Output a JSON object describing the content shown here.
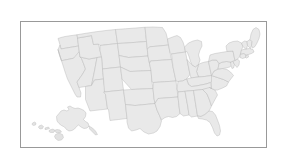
{
  "figure": {
    "type": "choropleth-base-map",
    "title": "",
    "subtitle": "",
    "background_color": "#ffffff"
  },
  "frame": {
    "name": "map-border",
    "stroke_color": "#999999",
    "stroke_width_px": 1,
    "x": 20,
    "y": 21,
    "width": 247,
    "height": 127
  },
  "map": {
    "name": "united-states-map",
    "region": "United States of America",
    "projection": "albers-usa",
    "land_fill_color": "#e9e9e9",
    "state_border_color": "#b8b8b8",
    "state_border_width_px": 0.45,
    "includes_alaska": true,
    "includes_hawaii": true,
    "labels_visible": false,
    "legend_visible": false,
    "states": [
      {
        "code": "WA",
        "name": "Washington"
      },
      {
        "code": "OR",
        "name": "Oregon"
      },
      {
        "code": "CA",
        "name": "California"
      },
      {
        "code": "NV",
        "name": "Nevada"
      },
      {
        "code": "ID",
        "name": "Idaho"
      },
      {
        "code": "MT",
        "name": "Montana"
      },
      {
        "code": "WY",
        "name": "Wyoming"
      },
      {
        "code": "UT",
        "name": "Utah"
      },
      {
        "code": "AZ",
        "name": "Arizona"
      },
      {
        "code": "CO",
        "name": "Colorado"
      },
      {
        "code": "NM",
        "name": "New Mexico"
      },
      {
        "code": "ND",
        "name": "North Dakota"
      },
      {
        "code": "SD",
        "name": "South Dakota"
      },
      {
        "code": "NE",
        "name": "Nebraska"
      },
      {
        "code": "KS",
        "name": "Kansas"
      },
      {
        "code": "OK",
        "name": "Oklahoma"
      },
      {
        "code": "TX",
        "name": "Texas"
      },
      {
        "code": "MN",
        "name": "Minnesota"
      },
      {
        "code": "IA",
        "name": "Iowa"
      },
      {
        "code": "MO",
        "name": "Missouri"
      },
      {
        "code": "AR",
        "name": "Arkansas"
      },
      {
        "code": "LA",
        "name": "Louisiana"
      },
      {
        "code": "WI",
        "name": "Wisconsin"
      },
      {
        "code": "IL",
        "name": "Illinois"
      },
      {
        "code": "MI",
        "name": "Michigan"
      },
      {
        "code": "IN",
        "name": "Indiana"
      },
      {
        "code": "OH",
        "name": "Ohio"
      },
      {
        "code": "KY",
        "name": "Kentucky"
      },
      {
        "code": "TN",
        "name": "Tennessee"
      },
      {
        "code": "MS",
        "name": "Mississippi"
      },
      {
        "code": "AL",
        "name": "Alabama"
      },
      {
        "code": "GA",
        "name": "Georgia"
      },
      {
        "code": "FL",
        "name": "Florida"
      },
      {
        "code": "SC",
        "name": "South Carolina"
      },
      {
        "code": "NC",
        "name": "North Carolina"
      },
      {
        "code": "VA",
        "name": "Virginia"
      },
      {
        "code": "WV",
        "name": "West Virginia"
      },
      {
        "code": "MD",
        "name": "Maryland"
      },
      {
        "code": "DE",
        "name": "Delaware"
      },
      {
        "code": "PA",
        "name": "Pennsylvania"
      },
      {
        "code": "NJ",
        "name": "New Jersey"
      },
      {
        "code": "NY",
        "name": "New York"
      },
      {
        "code": "CT",
        "name": "Connecticut"
      },
      {
        "code": "RI",
        "name": "Rhode Island"
      },
      {
        "code": "MA",
        "name": "Massachusetts"
      },
      {
        "code": "VT",
        "name": "Vermont"
      },
      {
        "code": "NH",
        "name": "New Hampshire"
      },
      {
        "code": "ME",
        "name": "Maine"
      },
      {
        "code": "AK",
        "name": "Alaska"
      },
      {
        "code": "HI",
        "name": "Hawaii"
      }
    ],
    "inset_regions": [
      {
        "code": "AK",
        "name": "Alaska",
        "position": "bottom-right"
      },
      {
        "code": "HI",
        "name": "Hawaii",
        "position": "bottom-left"
      }
    ]
  }
}
